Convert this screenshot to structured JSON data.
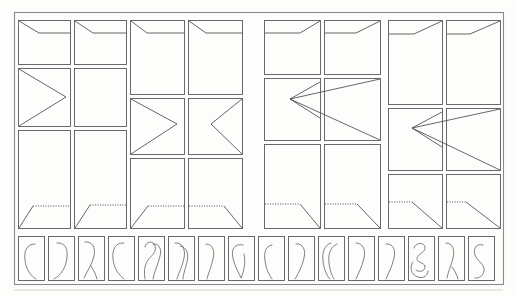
{
  "figure": {
    "title": "",
    "background_color": "#fdfdfc",
    "frame_color": "#8a8a8a",
    "panel_border_color": "#5a5a5a",
    "trace_color": "#4a4a4a",
    "glyph_color": "#6a6a6a",
    "outer_frame": {
      "x": 14,
      "y": 12,
      "width": 489,
      "height": 272
    }
  },
  "upper_grid": {
    "rows": 3,
    "columns": 8,
    "column_pairs": 4,
    "description": "Eight columns of three stacked rectangular panels; each column pair shares a vertical offset. Row 1 panels show a short descending-then-horizontal trace, row 2 panels show a chevron wedge, row 3 panels show a dotted horizontal trace with a diagonal tail.",
    "pair_offsets_px": [
      0,
      30,
      14,
      44
    ],
    "panels": [
      {
        "col": 1,
        "row": 1,
        "trace": "notch-left",
        "x": 18,
        "y": 20,
        "w": 52,
        "h": 44
      },
      {
        "col": 2,
        "row": 1,
        "trace": "notch-left",
        "x": 74,
        "y": 20,
        "w": 52,
        "h": 44
      },
      {
        "col": 3,
        "row": 1,
        "trace": "notch-left",
        "x": 130,
        "y": 20,
        "w": 54,
        "h": 74
      },
      {
        "col": 4,
        "row": 1,
        "trace": "notch-left",
        "x": 188,
        "y": 20,
        "w": 54,
        "h": 74
      },
      {
        "col": 5,
        "row": 1,
        "trace": "notch-right",
        "x": 264,
        "y": 20,
        "w": 56,
        "h": 54
      },
      {
        "col": 6,
        "row": 1,
        "trace": "notch-right",
        "x": 324,
        "y": 20,
        "w": 56,
        "h": 54
      },
      {
        "col": 7,
        "row": 1,
        "trace": "notch-right",
        "x": 388,
        "y": 20,
        "w": 54,
        "h": 84
      },
      {
        "col": 8,
        "row": 1,
        "trace": "notch-right",
        "x": 446,
        "y": 20,
        "w": 54,
        "h": 84
      },
      {
        "col": 1,
        "row": 2,
        "trace": "chevron-right-small",
        "x": 18,
        "y": 68,
        "w": 52,
        "h": 58
      },
      {
        "col": 2,
        "row": 2,
        "trace": "blank",
        "x": 74,
        "y": 68,
        "w": 52,
        "h": 58
      },
      {
        "col": 3,
        "row": 2,
        "trace": "chevron-right-small",
        "x": 130,
        "y": 98,
        "w": 54,
        "h": 56
      },
      {
        "col": 4,
        "row": 2,
        "trace": "chevron-left-small",
        "x": 188,
        "y": 98,
        "w": 54,
        "h": 56
      },
      {
        "col": 5,
        "row": 2,
        "trace": "wedge-left-wide-a",
        "x": 264,
        "y": 78,
        "w": 56,
        "h": 62
      },
      {
        "col": 6,
        "row": 2,
        "trace": "wedge-left-wide-b",
        "x": 324,
        "y": 78,
        "w": 56,
        "h": 62
      },
      {
        "col": 7,
        "row": 2,
        "trace": "wedge-left-wide-a",
        "x": 388,
        "y": 108,
        "w": 54,
        "h": 62
      },
      {
        "col": 8,
        "row": 2,
        "trace": "wedge-left-wide-b",
        "x": 446,
        "y": 108,
        "w": 54,
        "h": 62
      },
      {
        "col": 1,
        "row": 3,
        "trace": "dotted-rise-left",
        "x": 18,
        "y": 130,
        "w": 52,
        "h": 98
      },
      {
        "col": 2,
        "row": 3,
        "trace": "dotted-rise-left",
        "x": 74,
        "y": 130,
        "w": 52,
        "h": 98
      },
      {
        "col": 3,
        "row": 3,
        "trace": "dotted-rise-left",
        "x": 130,
        "y": 158,
        "w": 54,
        "h": 70
      },
      {
        "col": 4,
        "row": 3,
        "trace": "dotted-fall-right",
        "x": 188,
        "y": 158,
        "w": 54,
        "h": 70
      },
      {
        "col": 5,
        "row": 3,
        "trace": "dotted-fall-right",
        "x": 264,
        "y": 144,
        "w": 56,
        "h": 84
      },
      {
        "col": 6,
        "row": 3,
        "trace": "dotted-fall-right",
        "x": 324,
        "y": 144,
        "w": 56,
        "h": 84
      },
      {
        "col": 7,
        "row": 3,
        "trace": "dotted-fall-right",
        "x": 388,
        "y": 174,
        "w": 54,
        "h": 54
      },
      {
        "col": 8,
        "row": 3,
        "trace": "dotted-fall-right",
        "x": 446,
        "y": 174,
        "w": 54,
        "h": 54
      }
    ]
  },
  "lower_strip": {
    "count": 16,
    "description": "A horizontal strip of sixteen narrow portrait panels, each containing a hand-drawn open curve glyph.",
    "panel_y": 236,
    "panel_height": 44,
    "panel_width": 26,
    "panel_gap": 4,
    "start_x": 18,
    "glyphs": [
      {
        "index": 1,
        "shape": "c-curve"
      },
      {
        "index": 2,
        "shape": "hook-right"
      },
      {
        "index": 3,
        "shape": "hook-with-tail"
      },
      {
        "index": 4,
        "shape": "tall-loop"
      },
      {
        "index": 5,
        "shape": "double-stroke-loop"
      },
      {
        "index": 6,
        "shape": "double-hook"
      },
      {
        "index": 7,
        "shape": "narrow-hook"
      },
      {
        "index": 8,
        "shape": "leaf-loop"
      },
      {
        "index": 9,
        "shape": "open-paren"
      },
      {
        "index": 10,
        "shape": "hook-right"
      },
      {
        "index": 11,
        "shape": "double-paren"
      },
      {
        "index": 12,
        "shape": "slim-hook"
      },
      {
        "index": 13,
        "shape": "comma-hook"
      },
      {
        "index": 14,
        "shape": "knot-scribble"
      },
      {
        "index": 15,
        "shape": "hook-with-tail"
      },
      {
        "index": 16,
        "shape": "s-curve"
      }
    ]
  }
}
